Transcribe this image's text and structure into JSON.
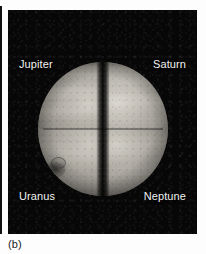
{
  "figure": {
    "caption": "(b)",
    "panel_background": "#070707",
    "label_color": "#f2f2f2",
    "caption_color": "#1c1c1c",
    "labels": [
      {
        "name": "Jupiter",
        "position": "top-left"
      },
      {
        "name": "Saturn",
        "position": "top-right"
      },
      {
        "name": "Uranus",
        "position": "bottom-left"
      },
      {
        "name": "Neptune",
        "position": "bottom-right"
      }
    ],
    "composite": {
      "description": "Composite sphere assembled from four planetary image quadrants",
      "quadrants": [
        {
          "id": "jupiter",
          "label": "Jupiter",
          "corner": "upper-left"
        },
        {
          "id": "saturn",
          "label": "Saturn",
          "corner": "upper-right"
        },
        {
          "id": "uranus",
          "label": "Uranus",
          "corner": "lower-left"
        },
        {
          "id": "neptune",
          "label": "Neptune",
          "corner": "lower-right"
        }
      ]
    }
  }
}
